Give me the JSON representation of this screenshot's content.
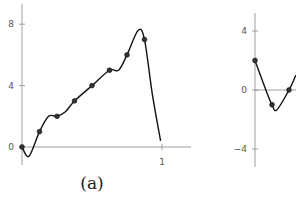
{
  "chart_data": [
    {
      "id": "a",
      "type": "line",
      "caption": "(a)",
      "title": "",
      "xlabel": "",
      "ylabel": "",
      "x_ticks": [
        {
          "value": 1,
          "label": "1"
        }
      ],
      "y_ticks": [
        {
          "value": 0,
          "label": "0"
        },
        {
          "value": 4,
          "label": "4"
        },
        {
          "value": 8,
          "label": "8"
        }
      ],
      "xlim": [
        0,
        1.2
      ],
      "ylim": [
        -1.2,
        9.3
      ],
      "grid": false,
      "points": {
        "x": [
          0,
          0.125,
          0.25,
          0.375,
          0.5,
          0.625,
          0.75,
          0.875
        ],
        "y": [
          0,
          1,
          2,
          3,
          4,
          5,
          6,
          7
        ]
      },
      "curve": {
        "x": [
          0,
          0.05,
          0.125,
          0.19,
          0.25,
          0.31,
          0.375,
          0.5,
          0.625,
          0.69,
          0.75,
          0.83,
          0.875,
          0.93,
          0.99
        ],
        "y": [
          0,
          -0.6,
          1,
          2.0,
          2,
          2.3,
          3,
          4,
          5,
          5.0,
          6,
          7.6,
          7,
          3.5,
          0.4
        ]
      }
    },
    {
      "id": "b",
      "type": "line",
      "caption": "",
      "title": "",
      "xlabel": "",
      "ylabel": "",
      "x_ticks": [],
      "y_ticks": [
        {
          "value": -4,
          "label": "−4"
        },
        {
          "value": 0,
          "label": "0"
        },
        {
          "value": 4,
          "label": "4"
        }
      ],
      "ylim": [
        -5.2,
        5.2
      ],
      "grid": false,
      "points": {
        "x": [
          0,
          0.125,
          0.25
        ],
        "y": [
          2,
          -1,
          0
        ]
      },
      "curve": {
        "x": [
          0,
          0.08,
          0.125,
          0.16,
          0.25,
          0.3
        ],
        "y": [
          2,
          0,
          -1,
          -1.35,
          0,
          1
        ]
      }
    }
  ]
}
